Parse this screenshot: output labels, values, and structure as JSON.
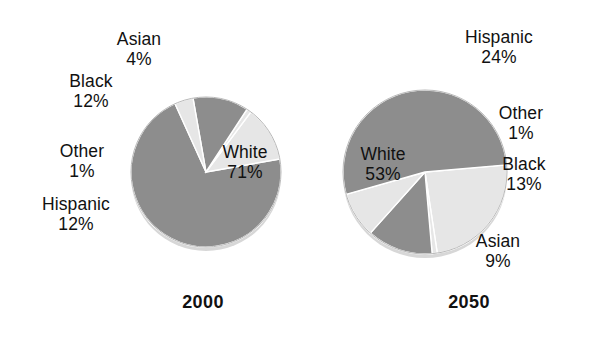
{
  "page": {
    "background_color": "#ffffff",
    "width": 606,
    "height": 338
  },
  "palette": {
    "dark_gray": "#8d8d8d",
    "light_gray": "#e6e6e6",
    "edge_gray": "#b9b9b9",
    "shadow_gray": "#d4d4d4",
    "text_color": "#111111"
  },
  "charts": [
    {
      "id": "chart-2000",
      "year_label": "2000",
      "labels": {
        "white_cat": "White",
        "white_pct": "71%",
        "black_cat": "Black",
        "black_pct": "12%",
        "asian_cat": "Asian",
        "asian_pct": "4%",
        "other_cat": "Other",
        "other_pct": "1%",
        "hispanic_cat": "Hispanic",
        "hispanic_pct": "12%"
      }
    },
    {
      "id": "chart-2050",
      "year_label": "2050",
      "labels": {
        "white_cat": "White",
        "white_pct": "53%",
        "black_cat": "Black",
        "black_pct": "13%",
        "asian_cat": "Asian",
        "asian_pct": "9%",
        "other_cat": "Other",
        "other_pct": "1%",
        "hispanic_cat": "Hispanic",
        "hispanic_pct": "24%"
      }
    }
  ],
  "chart_data": [
    {
      "type": "pie",
      "title": "2000",
      "categories": [
        "White",
        "Asian",
        "Black",
        "Other",
        "Hispanic"
      ],
      "values": [
        71,
        4,
        12,
        1,
        12
      ],
      "value_labels": [
        "71%",
        "4%",
        "12%",
        "1%",
        "12%"
      ],
      "units": "percent",
      "colors": [
        "#8d8d8d",
        "#e6e6e6",
        "#8d8d8d",
        "#e6e6e6",
        "#e6e6e6"
      ],
      "start_angle_deg": -10,
      "direction": "clockwise",
      "label_placement": [
        "inside",
        "outside",
        "outside",
        "outside",
        "outside"
      ],
      "legend": "none",
      "grid": false
    },
    {
      "type": "pie",
      "title": "2050",
      "categories": [
        "Hispanic",
        "Other",
        "Black",
        "Asian",
        "White"
      ],
      "values": [
        24,
        1,
        13,
        9,
        53
      ],
      "value_labels": [
        "24%",
        "1%",
        "13%",
        "9%",
        "53%"
      ],
      "units": "percent",
      "colors": [
        "#e6e6e6",
        "#e6e6e6",
        "#8d8d8d",
        "#e6e6e6",
        "#8d8d8d"
      ],
      "start_angle_deg": -5,
      "direction": "clockwise",
      "label_placement": [
        "outside",
        "outside",
        "outside",
        "outside",
        "inside"
      ],
      "legend": "none",
      "grid": false
    }
  ]
}
